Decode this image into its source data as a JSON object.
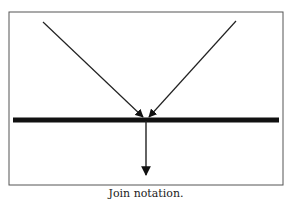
{
  "diagram": {
    "title": "Join notation",
    "caption": "Join notation.",
    "frame": {
      "x": 9,
      "y": 12,
      "width": 274,
      "height": 173,
      "stroke": "#555555"
    },
    "bar": {
      "x1": 13,
      "x2": 279,
      "y": 120,
      "thickness": 5,
      "color": "#111111"
    },
    "incoming_arrows": [
      {
        "from": [
          43,
          22
        ],
        "to": [
          143,
          117
        ]
      },
      {
        "from": [
          236,
          21
        ],
        "to": [
          149,
          117
        ]
      }
    ],
    "outgoing_arrow": {
      "from": [
        146,
        121
      ],
      "to": [
        146,
        175
      ]
    },
    "colors": {
      "line": "#222222",
      "background": "#ffffff"
    }
  }
}
